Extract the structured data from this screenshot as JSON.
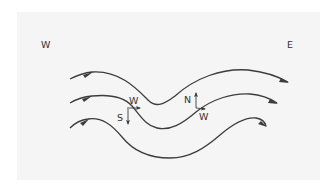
{
  "diagram": {
    "type": "flow-lines",
    "compass": {
      "west_label": "W",
      "east_label": "E"
    },
    "flow_lines": [
      {
        "name": "upper",
        "direction": "west-to-east"
      },
      {
        "name": "middle",
        "direction": "west-to-east"
      },
      {
        "name": "lower",
        "direction": "west-to-east"
      }
    ],
    "components": [
      {
        "name": "trough-components",
        "labels": {
          "horizontal": "W",
          "vertical": "S"
        }
      },
      {
        "name": "ridge-components",
        "labels": {
          "vertical": "N",
          "horizontal": "W"
        }
      }
    ],
    "colors": {
      "background": "#ffffff",
      "panel": "#f5f5f5",
      "line": "#3c3c3c",
      "text": "#333333"
    }
  }
}
